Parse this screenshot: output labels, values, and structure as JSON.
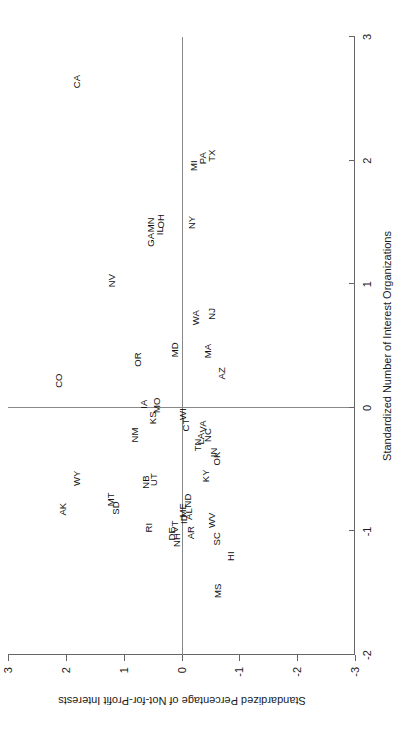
{
  "chart_data": {
    "type": "scatter",
    "title": "",
    "xlabel": "Standardized Number of Interest Organizations",
    "ylabel": "Standardized Percentage of Not-for-Profit Interests",
    "xlim": [
      -2,
      3
    ],
    "ylim": [
      -3,
      3
    ],
    "xticks": [
      -2,
      -1,
      0,
      1,
      2,
      3
    ],
    "xtick_labels": [
      "-2",
      "-1",
      "0",
      "1",
      "2",
      "3"
    ],
    "yticks": [
      -3,
      -2,
      -1,
      0,
      1,
      2,
      3
    ],
    "ytick_labels": [
      "-3",
      "-2",
      "-1",
      "0",
      "1",
      "2",
      "3"
    ],
    "grid": false,
    "legend": null,
    "marker_style": "text-label",
    "reference_lines": [
      {
        "axis": "x",
        "value": 0
      },
      {
        "axis": "y",
        "value": 0
      }
    ],
    "points": [
      {
        "label": "CA",
        "x": 2.64,
        "y": 1.8
      },
      {
        "label": "MI",
        "x": 1.96,
        "y": -0.21
      },
      {
        "label": "PA",
        "x": 2.02,
        "y": -0.38
      },
      {
        "label": "TX",
        "x": 2.04,
        "y": -0.52
      },
      {
        "label": "NY",
        "x": 1.5,
        "y": -0.18
      },
      {
        "label": "GA",
        "x": 1.36,
        "y": 0.52
      },
      {
        "label": "IL",
        "x": 1.43,
        "y": 0.38
      },
      {
        "label": "MN",
        "x": 1.48,
        "y": 0.52
      },
      {
        "label": "OH",
        "x": 1.51,
        "y": 0.36
      },
      {
        "label": "NV",
        "x": 1.03,
        "y": 1.2
      },
      {
        "label": "WA",
        "x": 0.73,
        "y": -0.25
      },
      {
        "label": "NJ",
        "x": 0.76,
        "y": -0.53
      },
      {
        "label": "MA",
        "x": 0.46,
        "y": -0.45
      },
      {
        "label": "AZ",
        "x": 0.28,
        "y": -0.7
      },
      {
        "label": "MD",
        "x": 0.47,
        "y": 0.11
      },
      {
        "label": "OR",
        "x": 0.39,
        "y": 0.75
      },
      {
        "label": "CO",
        "x": 0.22,
        "y": 2.12
      },
      {
        "label": "IA",
        "x": 0.03,
        "y": 0.64
      },
      {
        "label": "MO",
        "x": 0.02,
        "y": 0.42
      },
      {
        "label": "KS",
        "x": -0.08,
        "y": 0.49
      },
      {
        "label": "WI",
        "x": -0.05,
        "y": -0.02
      },
      {
        "label": "CT",
        "x": -0.14,
        "y": -0.08
      },
      {
        "label": "VA",
        "x": -0.15,
        "y": -0.38
      },
      {
        "label": "NC",
        "x": -0.22,
        "y": -0.45
      },
      {
        "label": "LA",
        "x": -0.25,
        "y": -0.34
      },
      {
        "label": "TN",
        "x": -0.3,
        "y": -0.28
      },
      {
        "label": "IN",
        "x": -0.36,
        "y": -0.57
      },
      {
        "label": "OK",
        "x": -0.41,
        "y": -0.62
      },
      {
        "label": "KY",
        "x": -0.55,
        "y": -0.42
      },
      {
        "label": "NM",
        "x": -0.22,
        "y": 0.8
      },
      {
        "label": "WY",
        "x": -0.57,
        "y": 1.8
      },
      {
        "label": "AK",
        "x": -0.82,
        "y": 2.05
      },
      {
        "label": "MT",
        "x": -0.74,
        "y": 1.22
      },
      {
        "label": "SD",
        "x": -0.81,
        "y": 1.14
      },
      {
        "label": "NB",
        "x": -0.6,
        "y": 0.62
      },
      {
        "label": "UT",
        "x": -0.58,
        "y": 0.48
      },
      {
        "label": "ND",
        "x": -0.75,
        "y": -0.12
      },
      {
        "label": "ME",
        "x": -0.83,
        "y": -0.02
      },
      {
        "label": "AL",
        "x": -0.86,
        "y": -0.13
      },
      {
        "label": "ID",
        "x": -0.9,
        "y": -0.05
      },
      {
        "label": "VT",
        "x": -0.96,
        "y": 0.11
      },
      {
        "label": "DE",
        "x": -1.02,
        "y": 0.16
      },
      {
        "label": "NH",
        "x": -1.07,
        "y": 0.08
      },
      {
        "label": "AR",
        "x": -1.01,
        "y": -0.16
      },
      {
        "label": "RI",
        "x": -0.97,
        "y": 0.56
      },
      {
        "label": "WV",
        "x": -0.91,
        "y": -0.52
      },
      {
        "label": "SC",
        "x": -1.06,
        "y": -0.62
      },
      {
        "label": "HI",
        "x": -1.2,
        "y": -0.86
      },
      {
        "label": "MS",
        "x": -1.48,
        "y": -0.63
      }
    ]
  }
}
